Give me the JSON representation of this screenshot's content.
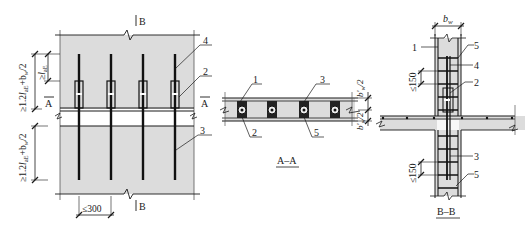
{
  "figure": {
    "colors": {
      "concrete": "#dcdcdc",
      "line": "#1a1a1a",
      "rebar": "#111111",
      "background": "#ffffff"
    },
    "elevation": {
      "section_mark_top": "B",
      "section_mark_bottom": "B",
      "section_mark_left": "A",
      "section_mark_right": "A",
      "dim_upper": "≥1.2l_aE+b_w/2",
      "dim_upper_main": "≥1.2",
      "dim_upper_l": "l",
      "dim_upper_sub": "aE",
      "dim_upper_tail": "+b",
      "dim_upper_tail_sub": "w",
      "dim_upper_end": "/2",
      "dim_lap": "≥l_aE",
      "dim_lap_main": "≥",
      "dim_lap_l": "l",
      "dim_lap_sub": "aE",
      "dim_lower_main": "≥1.2",
      "dim_lower_l": "l",
      "dim_lower_sub": "aE",
      "dim_lower_tail": "+b",
      "dim_lower_tail_sub": "w",
      "dim_lower_end": "/2",
      "dim_spacing": "≤300",
      "callouts": [
        "4",
        "2",
        "3"
      ]
    },
    "section_aa": {
      "title": "A–A",
      "callouts_top": [
        "1",
        "3"
      ],
      "callouts_bottom": [
        "2",
        "5"
      ],
      "dim_top": "b'_w/2",
      "dim_top_main": "b'",
      "dim_top_sub": "w",
      "dim_top_end": "/2",
      "dim_bottom_main": "b'",
      "dim_bottom_sub": "w",
      "dim_bottom_end": "/2"
    },
    "section_bb": {
      "title": "B–B",
      "dim_width_main": "b",
      "dim_width_sub": "w",
      "dim_spacing_upper": "≤150",
      "dim_spacing_lower": "≤150",
      "callouts": [
        "1",
        "5",
        "4",
        "2",
        "3",
        "5"
      ]
    }
  }
}
